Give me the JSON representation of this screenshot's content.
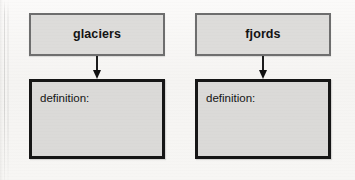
{
  "worksheet": {
    "background_color": "#f7f6f4",
    "columns": [
      {
        "id": "glaciers",
        "term": {
          "label": "glaciers",
          "fill_color": "#dddcda",
          "border_color": "#6e6e6e"
        },
        "connector": {
          "icon": "down-arrow-icon",
          "color": "#161616"
        },
        "definition": {
          "label": "definition:",
          "value": "",
          "fill_color": "#dbdad8",
          "border_color": "#161616"
        }
      },
      {
        "id": "fjords",
        "term": {
          "label": "fjords",
          "fill_color": "#dddcda",
          "border_color": "#6e6e6e"
        },
        "connector": {
          "icon": "down-arrow-icon",
          "color": "#161616"
        },
        "definition": {
          "label": "definition:",
          "value": "",
          "fill_color": "#dbdad8",
          "border_color": "#161616"
        }
      }
    ]
  }
}
